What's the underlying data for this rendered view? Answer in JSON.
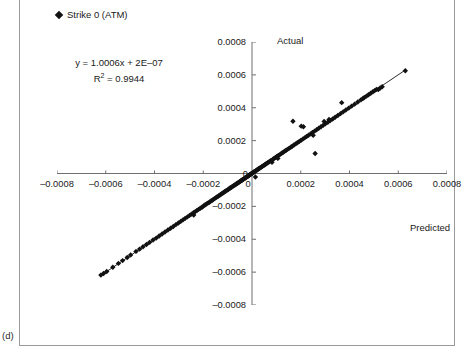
{
  "figure": {
    "caption": "(d)",
    "legend": {
      "marker": "diamond-marker",
      "label": "Strike 0 (ATM)"
    },
    "annotations": {
      "equation": "y = 1.0006x + 2E–07",
      "r_squared_prefix": "R",
      "r_squared_exponent": "2",
      "r_squared_value": " = 0.9944"
    }
  },
  "chart_data": {
    "type": "scatter",
    "title": "",
    "xlabel": "Predicted",
    "ylabel": "Actual",
    "xlim": [
      -0.0008,
      0.0008
    ],
    "ylim": [
      -0.0008,
      0.0008
    ],
    "grid": false,
    "legend_position": "top-left",
    "xticks": [
      -0.0008,
      -0.0006,
      -0.0004,
      -0.0002,
      0,
      0.0002,
      0.0004,
      0.0006,
      0.0008
    ],
    "xticklabels": [
      "–0.0008",
      "–0.0006",
      "–0.0004",
      "–0.0002",
      "0",
      "0.0002",
      "0.0004",
      "0.0006",
      "0.0008"
    ],
    "yticks": [
      -0.0008,
      -0.0006,
      -0.0004,
      -0.0002,
      0,
      0.0002,
      0.0004,
      0.0006,
      0.0008
    ],
    "yticklabels": [
      "–0.0008",
      "–0.0006",
      "–0.0004",
      "–0.0002",
      "0",
      "0.0002",
      "0.0004",
      "0.0006",
      "0.0008"
    ],
    "axes_cross_at_origin": true,
    "trendline": {
      "slope": 1.0006,
      "intercept": 2e-07,
      "r_squared": 0.9944,
      "x_start": -0.00062,
      "x_end": 0.00063
    },
    "series": [
      {
        "name": "Strike 0 (ATM)",
        "marker": "diamond",
        "color": "#111111",
        "points": [
          [
            -0.00062,
            -0.000618
          ],
          [
            -0.000609,
            -0.000608
          ],
          [
            -0.000596,
            -0.000596
          ],
          [
            -0.000571,
            -0.00057
          ],
          [
            -0.000548,
            -0.000547
          ],
          [
            -0.000531,
            -0.00053
          ],
          [
            -0.000512,
            -0.000511
          ],
          [
            -0.000498,
            -0.000496
          ],
          [
            -0.000476,
            -0.000474
          ],
          [
            -0.000461,
            -0.00046
          ],
          [
            -0.000447,
            -0.000446
          ],
          [
            -0.000433,
            -0.000432
          ],
          [
            -0.00042,
            -0.000419
          ],
          [
            -0.000406,
            -0.000405
          ],
          [
            -0.000393,
            -0.000393
          ],
          [
            -0.000381,
            -0.00038
          ],
          [
            -0.000369,
            -0.000368
          ],
          [
            -0.000357,
            -0.000356
          ],
          [
            -0.000345,
            -0.000344
          ],
          [
            -0.000334,
            -0.000333
          ],
          [
            -0.000323,
            -0.000322
          ],
          [
            -0.000312,
            -0.000311
          ],
          [
            -0.000302,
            -0.000301
          ],
          [
            -0.000292,
            -0.000291
          ],
          [
            -0.000283,
            -0.000282
          ],
          [
            -0.000274,
            -0.000273
          ],
          [
            -0.000265,
            -0.000264
          ],
          [
            -0.000256,
            -0.000255
          ],
          [
            -0.000248,
            -0.000247
          ],
          [
            -0.00024,
            -0.000239
          ],
          [
            -0.000239,
            -0.000253
          ],
          [
            -0.000233,
            -0.000232
          ],
          [
            -0.000226,
            -0.000225
          ],
          [
            -0.000219,
            -0.000218
          ],
          [
            -0.000212,
            -0.000211
          ],
          [
            -0.000205,
            -0.000205
          ],
          [
            -0.000199,
            -0.000198
          ],
          [
            -0.000193,
            -0.000192
          ],
          [
            -0.000187,
            -0.000186
          ],
          [
            -0.000181,
            -0.00018
          ],
          [
            -0.000175,
            -0.000175
          ],
          [
            -0.00017,
            -0.000169
          ],
          [
            -0.000164,
            -0.000164
          ],
          [
            -0.000159,
            -0.000158
          ],
          [
            -0.000154,
            -0.000153
          ],
          [
            -0.000149,
            -0.000148
          ],
          [
            -0.000144,
            -0.000143
          ],
          [
            -0.000139,
            -0.000139
          ],
          [
            -0.000135,
            -0.000134
          ],
          [
            -0.00013,
            -0.000129
          ],
          [
            -0.000126,
            -0.000125
          ],
          [
            -0.000122,
            -0.000121
          ],
          [
            -0.000118,
            -0.000117
          ],
          [
            -0.000114,
            -0.000113
          ],
          [
            -0.00011,
            -0.000109
          ],
          [
            -0.000106,
            -0.000105
          ],
          [
            -0.000102,
            -0.000101
          ],
          [
            -9.8e-05,
            -9.8e-05
          ],
          [
            -9.5e-05,
            -9.4e-05
          ],
          [
            -9.1e-05,
            -9e-05
          ],
          [
            -8.8e-05,
            -8.7e-05
          ],
          [
            -8.4e-05,
            -8.4e-05
          ],
          [
            -8.1e-05,
            -8e-05
          ],
          [
            -7.8e-05,
            -7.7e-05
          ],
          [
            -7.5e-05,
            -7.4e-05
          ],
          [
            -7.2e-05,
            -7.1e-05
          ],
          [
            -6.9e-05,
            -6.8e-05
          ],
          [
            -6.6e-05,
            -6.5e-05
          ],
          [
            -6.3e-05,
            -6.2e-05
          ],
          [
            -6e-05,
            -5.9e-05
          ],
          [
            -5.7e-05,
            -5.6e-05
          ],
          [
            -5.4e-05,
            -5.4e-05
          ],
          [
            -5.2e-05,
            -5.1e-05
          ],
          [
            -4.9e-05,
            -4.8e-05
          ],
          [
            -4.6e-05,
            -4.6e-05
          ],
          [
            -4.4e-05,
            -4.3e-05
          ],
          [
            -4.1e-05,
            -4.1e-05
          ],
          [
            -3.9e-05,
            -3.8e-05
          ],
          [
            -3.6e-05,
            -3.6e-05
          ],
          [
            -3.4e-05,
            -3.3e-05
          ],
          [
            -3.2e-05,
            -3.1e-05
          ],
          [
            -2.9e-05,
            -2.9e-05
          ],
          [
            -2.7e-05,
            -2.6e-05
          ],
          [
            -2.5e-05,
            -2.4e-05
          ],
          [
            -2.3e-05,
            -2.2e-05
          ],
          [
            -2.1e-05,
            -2e-05
          ],
          [
            -1.8e-05,
            -1.8e-05
          ],
          [
            -1.6e-05,
            -1.6e-05
          ],
          [
            -1.4e-05,
            -1.3e-05
          ],
          [
            -1.2e-05,
            -1.1e-05
          ],
          [
            -1e-05,
            -9e-06
          ],
          [
            -8e-06,
            -7e-06
          ],
          [
            -6e-06,
            -5e-06
          ],
          [
            -4e-06,
            -3e-06
          ],
          [
            -2e-06,
            -1e-06
          ],
          [
            0.0,
            1e-06
          ],
          [
            2e-06,
            3e-06
          ],
          [
            4e-06,
            5e-06
          ],
          [
            6e-06,
            7e-06
          ],
          [
            8e-06,
            9e-06
          ],
          [
            1e-05,
            1.1e-05
          ],
          [
            1.2e-05,
            1.3e-05
          ],
          [
            1.4e-05,
            -2.1e-05
          ],
          [
            1.6e-05,
            1.7e-05
          ],
          [
            1.9e-05,
            2e-05
          ],
          [
            2.1e-05,
            2.2e-05
          ],
          [
            2.4e-05,
            2.5e-05
          ],
          [
            2.6e-05,
            2.7e-05
          ],
          [
            2.9e-05,
            3e-05
          ],
          [
            3.2e-05,
            3.3e-05
          ],
          [
            3.5e-05,
            3.6e-05
          ],
          [
            3.8e-05,
            3.9e-05
          ],
          [
            4.1e-05,
            4.2e-05
          ],
          [
            4.4e-05,
            4.5e-05
          ],
          [
            4.7e-05,
            4.8e-05
          ],
          [
            5.1e-05,
            5.2e-05
          ],
          [
            5.4e-05,
            5.5e-05
          ],
          [
            5.8e-05,
            5.9e-05
          ],
          [
            6.2e-05,
            6.3e-05
          ],
          [
            6.6e-05,
            6.7e-05
          ],
          [
            7e-05,
            7.1e-05
          ],
          [
            7.4e-05,
            7.5e-05
          ],
          [
            7.8e-05,
            7.9e-05
          ],
          [
            8.2e-05,
            6.8e-05
          ],
          [
            8.7e-05,
            8.8e-05
          ],
          [
            9.1e-05,
            9.2e-05
          ],
          [
            9.6e-05,
            9.7e-05
          ],
          [
            0.000101,
            0.000102
          ],
          [
            0.000106,
            0.000107
          ],
          [
            0.000106,
            9.2e-05
          ],
          [
            0.000111,
            0.000112
          ],
          [
            0.000117,
            0.000118
          ],
          [
            0.000122,
            0.000123
          ],
          [
            0.000128,
            0.000129
          ],
          [
            0.000134,
            0.000135
          ],
          [
            0.00014,
            0.000141
          ],
          [
            0.000146,
            0.000147
          ],
          [
            0.000152,
            0.000153
          ],
          [
            0.000159,
            0.00016
          ],
          [
            0.000165,
            0.000166
          ],
          [
            0.000168,
            0.000318
          ],
          [
            0.000172,
            0.000173
          ],
          [
            0.000179,
            0.00018
          ],
          [
            0.000186,
            0.000187
          ],
          [
            0.000193,
            0.000194
          ],
          [
            0.0002,
            0.000201
          ],
          [
            0.000202,
            0.000288
          ],
          [
            0.000208,
            0.000209
          ],
          [
            0.000211,
            0.000284
          ],
          [
            0.000216,
            0.000217
          ],
          [
            0.000224,
            0.000225
          ],
          [
            0.000232,
            0.000233
          ],
          [
            0.00024,
            0.000241
          ],
          [
            0.000248,
            0.000249
          ],
          [
            0.000251,
            0.000232
          ],
          [
            0.000257,
            0.000258
          ],
          [
            0.000259,
            0.000122
          ],
          [
            0.000265,
            0.000266
          ],
          [
            0.000274,
            0.000275
          ],
          [
            0.000283,
            0.000284
          ],
          [
            0.000292,
            0.000293
          ],
          [
            0.000296,
            0.000316
          ],
          [
            0.000301,
            0.000302
          ],
          [
            0.000311,
            0.000312
          ],
          [
            0.000316,
            0.000329
          ],
          [
            0.000321,
            0.000322
          ],
          [
            0.000331,
            0.000332
          ],
          [
            0.000341,
            0.000342
          ],
          [
            0.000352,
            0.000353
          ],
          [
            0.000363,
            0.000364
          ],
          [
            0.000368,
            0.000431
          ],
          [
            0.000374,
            0.000375
          ],
          [
            0.000385,
            0.000386
          ],
          [
            0.000397,
            0.000398
          ],
          [
            0.000409,
            0.00041
          ],
          [
            0.000421,
            0.000422
          ],
          [
            0.000434,
            0.000435
          ],
          [
            0.000447,
            0.000448
          ],
          [
            0.000455,
            0.000456
          ],
          [
            0.000461,
            0.000462
          ],
          [
            0.00047,
            0.000471
          ],
          [
            0.000478,
            0.000479
          ],
          [
            0.000487,
            0.000488
          ],
          [
            0.000496,
            0.000497
          ],
          [
            0.000503,
            0.000504
          ],
          [
            0.000511,
            0.000512
          ],
          [
            0.000518,
            0.000511
          ],
          [
            0.000526,
            0.00052
          ],
          [
            0.000534,
            0.000528
          ],
          [
            0.000629,
            0.000625
          ]
        ]
      }
    ]
  }
}
